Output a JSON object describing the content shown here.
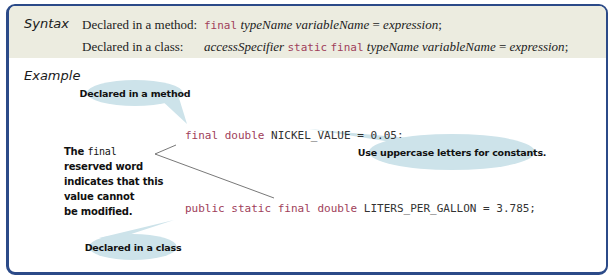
{
  "syntax": {
    "heading": "Syntax",
    "rows": [
      {
        "label": "Declared in a method:",
        "parts": {
          "kw1": "final",
          "type": "typeName",
          "var": "variableName",
          "eq": "=",
          "expr": "expression",
          "semi": ";"
        }
      },
      {
        "label": "Declared in a class:",
        "parts": {
          "access": "accessSpecifier",
          "kw1": "static",
          "kw2": "final",
          "type": "typeName",
          "var": "variableName",
          "eq": "=",
          "expr": "expression",
          "semi": ";"
        }
      }
    ]
  },
  "example": {
    "heading": "Example",
    "code_lines": [
      {
        "keywords": "final double",
        "rest": " NICKEL_VALUE = 0.05;"
      },
      {
        "keywords": "public static final double",
        "rest": " LITERS_PER_GALLON = 3.785;"
      }
    ],
    "callouts": {
      "method": "Declared in a method",
      "class": "Declared in a class",
      "uppercase": "Use uppercase letters for constants."
    },
    "note": {
      "line1_prefix": "The ",
      "line1_code": "final",
      "line2": "reserved word",
      "line3": "indicates that this",
      "line4": "value cannot",
      "line5": "be modified."
    }
  },
  "colors": {
    "frame_border": "#2b4a88",
    "syntax_bg": "#ecece0",
    "keyword": "#a0405a",
    "bubble": "#cde3ea"
  }
}
